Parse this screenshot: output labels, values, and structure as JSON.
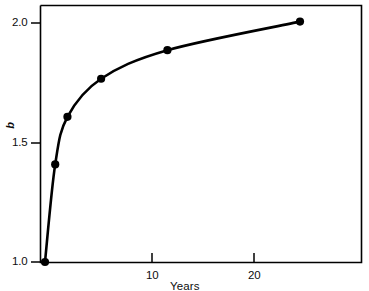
{
  "chart_data": {
    "type": "line",
    "title": "",
    "subtitle": "",
    "xlabel": "Years",
    "ylabel": "b",
    "xlim": [
      0,
      31
    ],
    "ylim": [
      1.0,
      2.06
    ],
    "grid": false,
    "legend": null,
    "x_ticks": [
      10,
      20
    ],
    "x_tick_labels": [
      "10",
      "20"
    ],
    "y_ticks": [
      1.0,
      1.5,
      2.0
    ],
    "y_tick_labels": [
      "1.0",
      "1.5",
      "2.0"
    ],
    "series": [
      {
        "name": "b",
        "marker": "filled-circle",
        "line_style": "solid",
        "color": "#000000",
        "x": [
          0,
          1,
          2.2,
          5.5,
          12,
          25
        ],
        "y": [
          1.0,
          1.41,
          1.61,
          1.77,
          1.89,
          2.01
        ],
        "points": [
          {
            "x": 0,
            "y": 1.0
          },
          {
            "x": 1,
            "y": 1.41
          },
          {
            "x": 2.2,
            "y": 1.61
          },
          {
            "x": 5.5,
            "y": 1.77
          },
          {
            "x": 12,
            "y": 1.89
          },
          {
            "x": 25,
            "y": 2.01
          }
        ]
      }
    ],
    "annotations": []
  },
  "axes": {
    "y_tick_2_0": "2.0",
    "y_tick_1_5": "1.5",
    "y_tick_1_0": "1.0",
    "x_tick_10": "10",
    "x_tick_20": "20",
    "x_title": "Years",
    "y_title": "b"
  },
  "colors": {
    "frame": "#000000",
    "curve": "#000000",
    "marker": "#000000",
    "background": "#ffffff",
    "text": "#0d0d0d"
  }
}
